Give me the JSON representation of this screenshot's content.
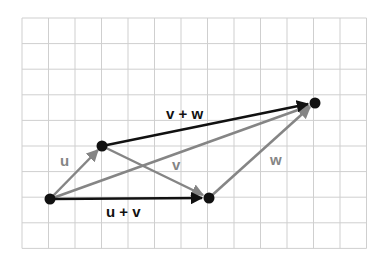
{
  "diagram": {
    "grid": {
      "x0": 22,
      "y0": 18,
      "cols": 13,
      "rows": 9,
      "cell_w": 26.5,
      "cell_h": 25.6,
      "color": "#cfcfcf"
    },
    "points": {
      "origin": {
        "x": 50,
        "y": 199
      },
      "u_end": {
        "x": 102,
        "y": 146
      },
      "uv_end": {
        "x": 209,
        "y": 198
      },
      "vw_end": {
        "x": 315,
        "y": 103
      }
    },
    "colors": {
      "black": "#111111",
      "gray": "#858585"
    },
    "labels": {
      "u": "u",
      "v": "v",
      "w": "w",
      "u_plus_v": "u + v",
      "v_plus_w": "v + w"
    }
  }
}
